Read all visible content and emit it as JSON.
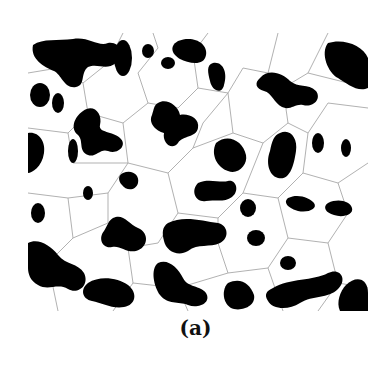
{
  "figure": {
    "caption": "(a)",
    "colors": {
      "domain": "#000000",
      "background": "#ffffff",
      "tessellation": "#a0a0a0"
    }
  }
}
